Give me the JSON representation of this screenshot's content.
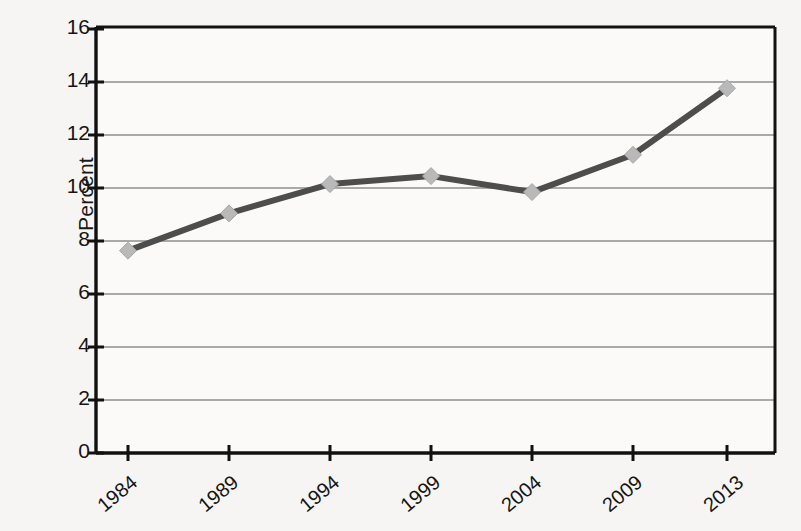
{
  "chart_data": {
    "type": "line",
    "title": "",
    "xlabel": "",
    "ylabel": "Percent",
    "categories": [
      "1984",
      "1989",
      "1994",
      "1999",
      "2004",
      "2009",
      "2013"
    ],
    "x": [
      1984,
      1989,
      1994,
      1999,
      2004,
      2009,
      2013
    ],
    "values": [
      7.6,
      9.0,
      10.1,
      10.4,
      9.8,
      11.2,
      13.7
    ],
    "series": [
      {
        "name": "Percent",
        "values": [
          7.6,
          9.0,
          10.1,
          10.4,
          9.8,
          11.2,
          13.7
        ]
      }
    ],
    "ylim": [
      0,
      16
    ],
    "ytick_labels": [
      "0",
      "2",
      "4",
      "6",
      "8",
      "10",
      "12",
      "14",
      "16"
    ],
    "ytick_values": [
      0,
      2,
      4,
      6,
      8,
      10,
      12,
      14,
      16
    ],
    "grid": "horizontal",
    "legend": "none",
    "marker": "diamond",
    "line_color": "#4d4d4d",
    "marker_color": "#b9b9b9",
    "grid_color": "#8c8c8c",
    "axis_color": "#111111",
    "background_color": "#f6f5f3"
  },
  "axis": {
    "y_label_text": "Percent"
  }
}
